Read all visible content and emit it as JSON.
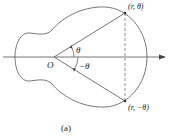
{
  "diagram": {
    "origin_label": "O",
    "angle_label_upper": "θ",
    "angle_label_lower": "−θ",
    "point_upper_label": "(r, θ)",
    "point_lower_label": "(r, −θ)",
    "caption": "(a)",
    "colors": {
      "stroke": "#555555",
      "text": "#222222",
      "background": "#ffffff"
    }
  }
}
